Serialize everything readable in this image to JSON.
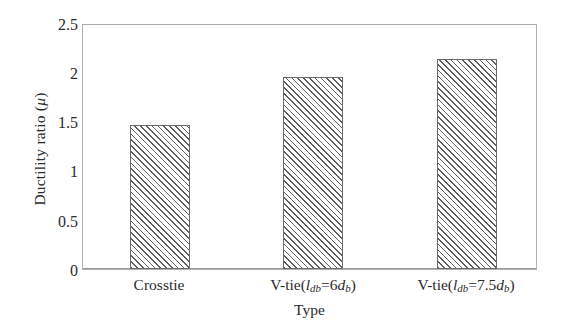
{
  "chart_data": {
    "type": "bar",
    "title": "",
    "xlabel": "Type",
    "ylabel": "Ductility ratio (μ)",
    "categories": [
      "Crosstie",
      "V-tie(l_db=6d_b)",
      "V-tie(l_db=7.5d_b)"
    ],
    "values": [
      1.48,
      1.97,
      2.15
    ],
    "ylim": [
      0,
      2.5
    ],
    "yticks": [
      "0",
      "0.5",
      "1",
      "1.5",
      "2",
      "2.5"
    ],
    "ytick_values": [
      0,
      0.5,
      1,
      1.5,
      2,
      2.5
    ],
    "grid": false,
    "legend": null,
    "series": [
      {
        "name": "Ductility ratio",
        "values": [
          1.48,
          1.97,
          2.15
        ],
        "fill": "diagonal-hatch",
        "fill_color": "#5e5e5e",
        "edge_color": "#6b6b6b"
      }
    ]
  },
  "axes": {
    "y_title_text": "Ductility ratio (",
    "y_title_symbol": "μ",
    "y_title_close": ")",
    "x_title": "Type",
    "frame_color": "#b0b0b0"
  },
  "x_labels": [
    {
      "id": "crosstie",
      "prefix": "Crosstie",
      "has_formula": false,
      "full": "Crosstie"
    },
    {
      "id": "v-tie-6db",
      "prefix": "V-tie(",
      "var1": "l",
      "sub1": "db",
      "eq": "=",
      "num": "6",
      "var2": "d",
      "sub2": "b",
      "suffix": ")",
      "has_formula": true,
      "full": "V-tie(l_db=6d_b)"
    },
    {
      "id": "v-tie-7.5db",
      "prefix": "V-tie(",
      "var1": "l",
      "sub1": "db",
      "eq": "=",
      "num": "7.5",
      "var2": "d",
      "sub2": "b",
      "suffix": ")",
      "has_formula": true,
      "full": "V-tie(l_db=7.5d_b)"
    }
  ],
  "y_tick_labels": [
    "2.5",
    "2",
    "1.5",
    "1",
    "0.5",
    "0"
  ]
}
